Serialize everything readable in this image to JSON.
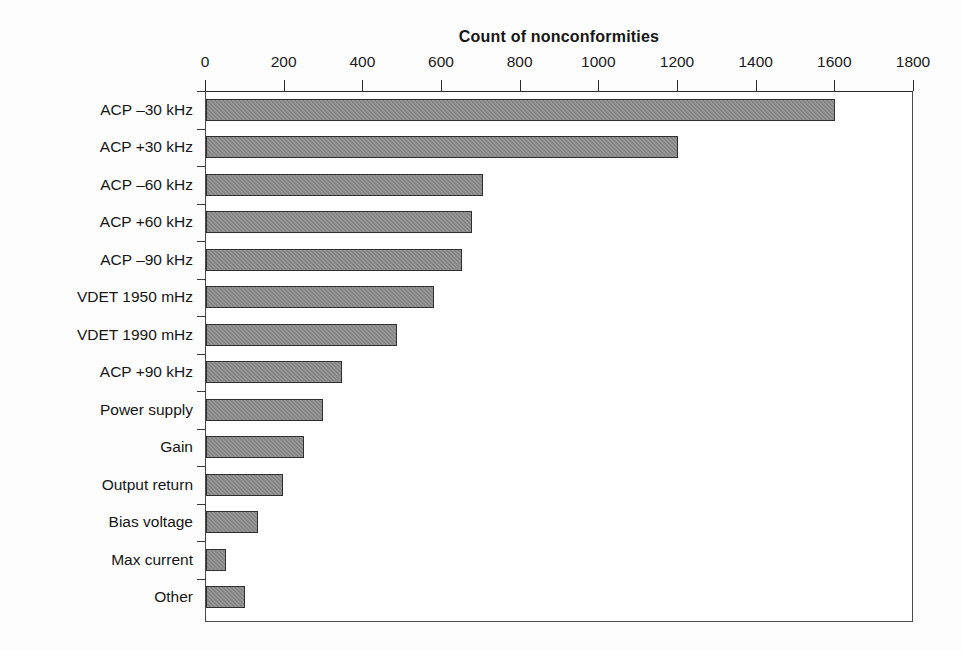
{
  "chart_data": {
    "type": "bar",
    "orientation": "horizontal",
    "title": "Count of nonconformities",
    "xlabel": "",
    "ylabel": "",
    "xlim": [
      0,
      1800
    ],
    "xticks": [
      0,
      200,
      400,
      600,
      800,
      1000,
      1200,
      1400,
      1600,
      1800
    ],
    "grid": false,
    "legend": null,
    "categories": [
      "ACP –30 kHz",
      "ACP +30 kHz",
      "ACP –60 kHz",
      "ACP +60 kHz",
      "ACP –90 kHz",
      "VDET 1950 mHz",
      "VDET 1990 mHz",
      "ACP +90 kHz",
      "Power supply",
      "Gain",
      "Output return",
      "Bias voltage",
      "Max current",
      "Other"
    ],
    "values": [
      1600,
      1200,
      705,
      675,
      650,
      580,
      485,
      345,
      297,
      250,
      195,
      132,
      50,
      100
    ],
    "bar_color": "#858585",
    "bar_border_color": "#2f2f2f",
    "axis_color": "#4a4a4a",
    "text_color": "#151515"
  }
}
